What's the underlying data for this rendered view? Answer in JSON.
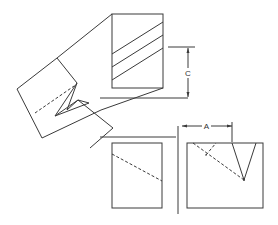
{
  "figure": {
    "dimensions": [
      {
        "label": "C",
        "orientation": "vertical"
      },
      {
        "label": "A",
        "orientation": "horizontal"
      }
    ],
    "colors": {
      "line": "#3a3a3a",
      "background": "#ffffff"
    }
  }
}
